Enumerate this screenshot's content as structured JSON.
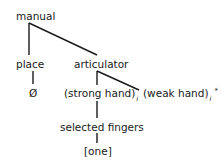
{
  "diagram": {
    "nodes": {
      "root": "manual",
      "place": "place",
      "articulator": "articulator",
      "empty": "Ø",
      "strong_hand": "(strong hand)",
      "strong_hand_sub": "i",
      "weak_hand": "(weak hand)",
      "weak_hand_sub": "i",
      "weak_hand_sup": "*",
      "selected_fingers": "selected fingers",
      "one": "[one]"
    },
    "edges": [
      [
        "manual",
        "place"
      ],
      [
        "manual",
        "articulator"
      ],
      [
        "place",
        "Ø"
      ],
      [
        "articulator",
        "(strong hand)"
      ],
      [
        "articulator",
        "(weak hand)"
      ],
      [
        "(strong hand)",
        "selected fingers"
      ],
      [
        "selected fingers",
        "[one]"
      ]
    ]
  }
}
